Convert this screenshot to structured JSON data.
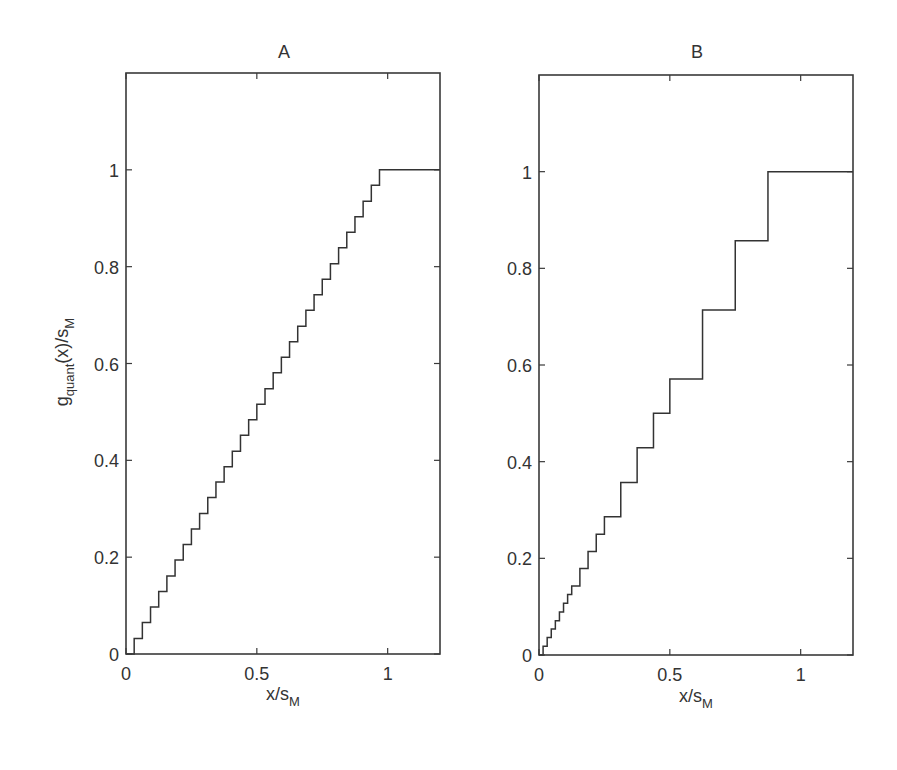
{
  "chart_data": [
    {
      "type": "line",
      "panel": "A",
      "title": "A",
      "xlabel": "x/s_M",
      "ylabel": "g_quant(x)/s_M",
      "xlim": [
        0,
        1.2
      ],
      "ylim": [
        0,
        1.2
      ],
      "xticks": [
        0,
        0.5,
        1
      ],
      "xtick_labels": [
        "0",
        "0.5",
        "1"
      ],
      "yticks": [
        0,
        0.2,
        0.4,
        0.6,
        0.8,
        1
      ],
      "ytick_labels": [
        "0",
        "0.2",
        "0.4",
        "0.6",
        "0.8",
        "1"
      ],
      "grid": false,
      "step": true,
      "description": "Uniform staircase quantizer: 31 equal rises of 1/31 at x = k/32, reaching 1 at x ≈ 0.969 then flat to 1.2",
      "rises": {
        "x": [
          0.03125,
          0.0625,
          0.09375,
          0.125,
          0.15625,
          0.1875,
          0.21875,
          0.25,
          0.28125,
          0.3125,
          0.34375,
          0.375,
          0.40625,
          0.4375,
          0.46875,
          0.5,
          0.53125,
          0.5625,
          0.59375,
          0.625,
          0.65625,
          0.6875,
          0.71875,
          0.75,
          0.78125,
          0.8125,
          0.84375,
          0.875,
          0.90625,
          0.9375,
          0.96875
        ],
        "y": [
          0.032,
          0.065,
          0.097,
          0.129,
          0.161,
          0.194,
          0.226,
          0.258,
          0.29,
          0.323,
          0.355,
          0.387,
          0.419,
          0.452,
          0.484,
          0.516,
          0.548,
          0.581,
          0.613,
          0.645,
          0.677,
          0.71,
          0.742,
          0.774,
          0.806,
          0.839,
          0.871,
          0.903,
          0.935,
          0.968,
          1.0
        ]
      }
    },
    {
      "type": "line",
      "panel": "B",
      "title": "B",
      "xlabel": "x/s_M",
      "ylabel": "",
      "xlim": [
        0,
        1.2
      ],
      "ylim": [
        0,
        1.2
      ],
      "xticks": [
        0,
        0.5,
        1
      ],
      "xtick_labels": [
        "0",
        "0.5",
        "1"
      ],
      "yticks": [
        0,
        0.2,
        0.4,
        0.6,
        0.8,
        1
      ],
      "ytick_labels": [
        "0",
        "0.2",
        "0.4",
        "0.6",
        "0.8",
        "1"
      ],
      "grid": false,
      "step": true,
      "description": "Non-uniform (segmented/companded) staircase quantizer: fine steps near 0, coarse steps near 1; reaches 1 at x = 0.875 then flat to 1.2",
      "rises": {
        "x": [
          0.015625,
          0.03125,
          0.046875,
          0.0625,
          0.078125,
          0.09375,
          0.109375,
          0.125,
          0.15625,
          0.1875,
          0.21875,
          0.25,
          0.3125,
          0.375,
          0.4375,
          0.5,
          0.625,
          0.75,
          0.875
        ],
        "y": [
          0.018,
          0.036,
          0.054,
          0.071,
          0.089,
          0.107,
          0.125,
          0.143,
          0.179,
          0.214,
          0.25,
          0.286,
          0.357,
          0.429,
          0.5,
          0.571,
          0.714,
          0.857,
          1.0
        ]
      }
    }
  ],
  "panels": {
    "a": {
      "title": "A",
      "xlabel_main": "x/s",
      "xlabel_sub": "M",
      "ylabel_g": "g",
      "ylabel_sub1": "quant",
      "ylabel_mid": "(x)/s",
      "ylabel_sub2": "M"
    },
    "b": {
      "title": "B",
      "xlabel_main": "x/s",
      "xlabel_sub": "M"
    }
  },
  "colors": {
    "line": "#333333",
    "axes": "#3a3a3a",
    "background": "#ffffff"
  }
}
